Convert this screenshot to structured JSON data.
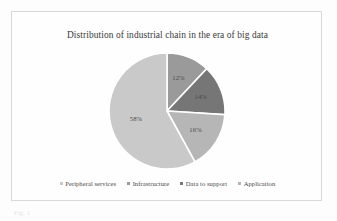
{
  "figure": {
    "title": "Distribution of industrial chain in the era of big data",
    "caption_fragment": "Fig. 1"
  },
  "chart_data": {
    "type": "pie",
    "title": "Distribution of industrial chain in the era of big data",
    "categories": [
      "Peripheral services",
      "Infrastructure",
      "Data to support",
      "Application"
    ],
    "values": [
      58,
      12,
      14,
      16
    ],
    "labels": [
      "58%",
      "12%",
      "14%",
      "16%"
    ],
    "colors": [
      "#c9c9c9",
      "#9a9a9a",
      "#767676",
      "#b6b6b6"
    ],
    "units": "percent",
    "legend_position": "bottom",
    "grid": false,
    "slices": [
      {
        "name": "Peripheral services",
        "value": 58,
        "label": "58%",
        "color": "#c9c9c9"
      },
      {
        "name": "Infrastructure",
        "value": 12,
        "label": "12%",
        "color": "#9a9a9a"
      },
      {
        "name": "Data to support",
        "value": 14,
        "label": "14%",
        "color": "#767676"
      },
      {
        "name": "Application",
        "value": 16,
        "label": "16%",
        "color": "#b6b6b6"
      }
    ]
  },
  "legend": {
    "items": [
      {
        "label": "Peripheral services",
        "color": "#c9c9c9"
      },
      {
        "label": "Infrastructure",
        "color": "#9a9a9a"
      },
      {
        "label": "Data to support",
        "color": "#767676"
      },
      {
        "label": "Application",
        "color": "#b6b6b6"
      }
    ]
  }
}
